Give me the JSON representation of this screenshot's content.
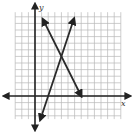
{
  "diagram": {
    "type": "coordinate-plane",
    "axis_labels": {
      "x": "x",
      "y": "y"
    },
    "grid": {
      "x_min": -3,
      "x_max": 13,
      "y_min": -3.5,
      "y_max": 12.7,
      "step": 1
    },
    "colors": {
      "grid": "#b8b8b8",
      "axis": "#222222",
      "line": "#2a2a2a",
      "background": "#ffffff"
    },
    "lines": [
      {
        "name": "decreasing-line",
        "slope": -2,
        "intercept": 14,
        "from": [
          1.2,
          11.6
        ],
        "to": [
          7,
          0
        ]
      },
      {
        "name": "increasing-line",
        "slope": 3,
        "intercept": -6,
        "from": [
          0.8,
          -3.6
        ],
        "to": [
          5.9,
          11.7
        ]
      }
    ],
    "intersection": [
      4,
      6
    ]
  }
}
